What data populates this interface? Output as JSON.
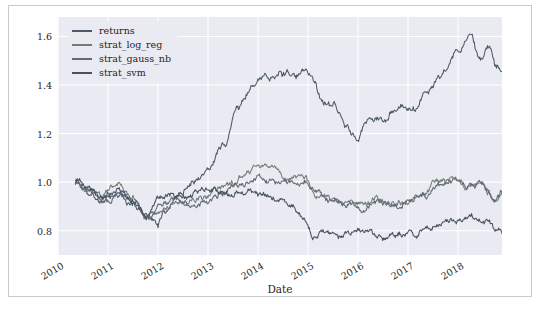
{
  "chart_data": {
    "type": "line",
    "title": "",
    "xlabel": "Date",
    "ylabel": "",
    "grid": true,
    "legend_position": "upper-left",
    "xlim": [
      "2010",
      "2018-12"
    ],
    "ylim": [
      0.7,
      1.68
    ],
    "yticks": [
      "1.6",
      "1.4",
      "1.2",
      "1.0",
      "0.8"
    ],
    "ytick_values": [
      1.6,
      1.4,
      1.2,
      1.0,
      0.8
    ],
    "xticks": [
      "2010",
      "2011",
      "2012",
      "2013",
      "2014",
      "2015",
      "2016",
      "2017",
      "2018"
    ],
    "xtick_values": [
      2010,
      2011,
      2012,
      2013,
      2014,
      2015,
      2016,
      2017,
      2018
    ],
    "x_start": 2010.35,
    "x_end": 2018.95,
    "series": [
      {
        "name": "returns",
        "color": "#4c5a66",
        "control_x": [
          2010.35,
          2010.6,
          2010.9,
          2011.2,
          2011.5,
          2011.75,
          2012.0,
          2012.1,
          2012.4,
          2012.7,
          2013.0,
          2013.3,
          2013.6,
          2013.9,
          2014.1,
          2014.4,
          2014.7,
          2014.9,
          2015.1,
          2015.3,
          2015.5,
          2015.75,
          2016.0,
          2016.2,
          2016.5,
          2016.8,
          2017.1,
          2017.4,
          2017.7,
          2018.0,
          2018.2,
          2018.45,
          2018.6,
          2018.8,
          2018.95
        ],
        "control_y": [
          1.0,
          0.97,
          0.93,
          0.95,
          0.9,
          0.86,
          0.82,
          0.88,
          0.95,
          1.0,
          1.05,
          1.15,
          1.3,
          1.4,
          1.42,
          1.45,
          1.44,
          1.45,
          1.42,
          1.33,
          1.3,
          1.25,
          1.17,
          1.26,
          1.25,
          1.3,
          1.32,
          1.38,
          1.45,
          1.55,
          1.6,
          1.52,
          1.55,
          1.47,
          1.43
        ]
      },
      {
        "name": "strat_log_reg",
        "color": "#6f7d74",
        "control_x": [
          2010.35,
          2010.6,
          2010.9,
          2011.2,
          2011.5,
          2011.8,
          2012.0,
          2012.3,
          2012.6,
          2012.9,
          2013.2,
          2013.5,
          2013.8,
          2014.0,
          2014.3,
          2014.6,
          2014.9,
          2015.2,
          2015.5,
          2015.8,
          2016.1,
          2016.4,
          2016.7,
          2017.0,
          2017.3,
          2017.6,
          2017.9,
          2018.2,
          2018.5,
          2018.75,
          2018.95
        ],
        "control_y": [
          1.0,
          0.97,
          0.95,
          0.98,
          0.93,
          0.86,
          0.88,
          0.92,
          0.91,
          0.93,
          0.97,
          1.0,
          1.05,
          1.07,
          1.06,
          1.02,
          1.02,
          0.95,
          0.93,
          0.92,
          0.9,
          0.93,
          0.91,
          0.92,
          0.95,
          1.0,
          1.02,
          0.99,
          1.0,
          0.92,
          0.97
        ]
      },
      {
        "name": "strat_gauss_nb",
        "color": "#5f6a77",
        "control_x": [
          2010.35,
          2010.65,
          2010.95,
          2011.25,
          2011.55,
          2011.8,
          2012.05,
          2012.35,
          2012.65,
          2012.95,
          2013.25,
          2013.55,
          2013.85,
          2014.05,
          2014.35,
          2014.65,
          2014.9,
          2015.2,
          2015.5,
          2015.8,
          2016.1,
          2016.4,
          2016.7,
          2017.0,
          2017.3,
          2017.6,
          2017.9,
          2018.2,
          2018.5,
          2018.75,
          2018.95
        ],
        "control_y": [
          1.0,
          0.96,
          0.92,
          0.95,
          0.92,
          0.85,
          0.9,
          0.93,
          0.9,
          0.92,
          0.95,
          0.99,
          1.0,
          1.02,
          1.0,
          1.0,
          1.01,
          0.96,
          0.92,
          0.91,
          0.89,
          0.92,
          0.9,
          0.92,
          0.94,
          0.99,
          1.01,
          0.98,
          0.99,
          0.93,
          0.96
        ]
      },
      {
        "name": "strat_svm",
        "color": "#46525e",
        "control_x": [
          2010.35,
          2010.6,
          2010.9,
          2011.2,
          2011.5,
          2011.8,
          2012.0,
          2012.3,
          2012.6,
          2012.9,
          2013.2,
          2013.5,
          2013.8,
          2014.1,
          2014.4,
          2014.7,
          2014.9,
          2015.1,
          2015.3,
          2015.6,
          2015.9,
          2016.2,
          2016.5,
          2016.8,
          2017.1,
          2017.4,
          2017.7,
          2018.0,
          2018.3,
          2018.6,
          2018.8,
          2018.95
        ],
        "control_y": [
          1.0,
          0.98,
          0.94,
          0.97,
          0.92,
          0.85,
          0.93,
          0.95,
          0.94,
          0.97,
          0.96,
          0.95,
          0.97,
          0.95,
          0.93,
          0.9,
          0.85,
          0.78,
          0.79,
          0.78,
          0.8,
          0.79,
          0.77,
          0.78,
          0.79,
          0.8,
          0.83,
          0.85,
          0.86,
          0.84,
          0.8,
          0.79
        ]
      }
    ]
  },
  "legend": {
    "items": [
      {
        "label": "returns",
        "color": "#4c5a66"
      },
      {
        "label": "strat_log_reg",
        "color": "#6f7d74"
      },
      {
        "label": "strat_gauss_nb",
        "color": "#5f6a77"
      },
      {
        "label": "strat_svm",
        "color": "#46525e"
      }
    ]
  },
  "style": {
    "plot_background": "#eaeaf2",
    "grid_color": "#ffffff",
    "figure_background": "#ffffff",
    "border_color": "#c9c9cf",
    "tick_text_color": "#262626"
  }
}
